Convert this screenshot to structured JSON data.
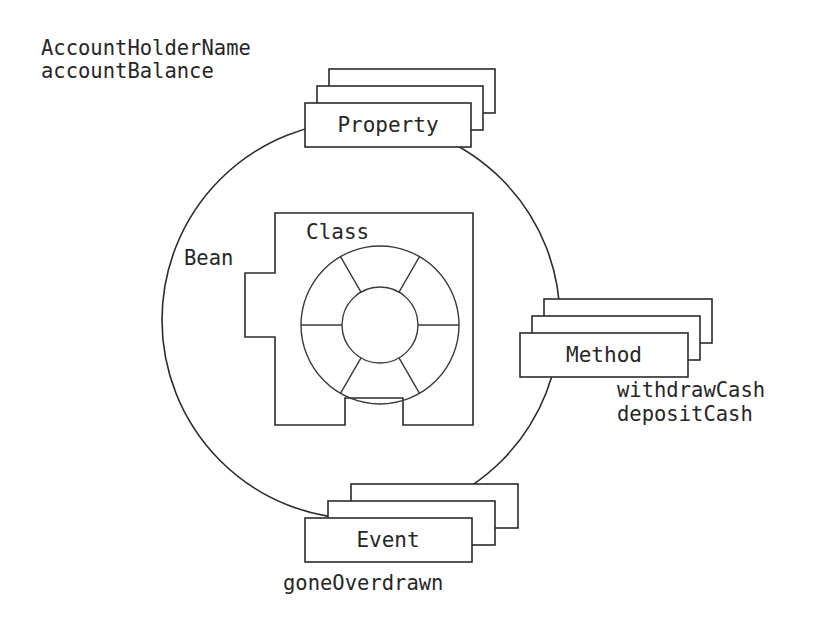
{
  "diagram": {
    "title_text": "JavaBean component anatomy diagram",
    "colors": {
      "stroke": "#2b2b2b",
      "thin_stroke": "#3a3a3a",
      "fill": "#ffffff",
      "text": "#262626",
      "background": "#ffffff"
    },
    "bean": {
      "label": "Bean",
      "shape": "circle"
    },
    "core": {
      "label": "Class",
      "shape": "notched-square-with-wheel",
      "wheel_spokes": 6
    },
    "stacks": [
      {
        "id": "property",
        "label": "Property",
        "count": 3,
        "annotation_lines": [
          "AccountHolderName",
          "accountBalance"
        ]
      },
      {
        "id": "method",
        "label": "Method",
        "count": 3,
        "annotation_lines": [
          "withdrawCash",
          "depositCash"
        ]
      },
      {
        "id": "event",
        "label": "Event",
        "count": 3,
        "annotation_lines": [
          "goneOverdrawn"
        ]
      }
    ],
    "annotations": {
      "property_line1": "AccountHolderName",
      "property_line2": "accountBalance",
      "method_line1": "withdrawCash",
      "method_line2": "depositCash",
      "event_line1": "goneOverdrawn"
    }
  }
}
